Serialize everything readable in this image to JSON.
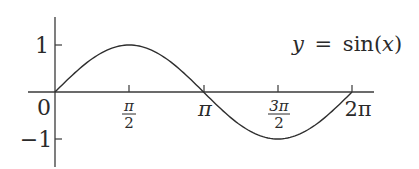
{
  "chart_data": {
    "type": "line",
    "title": "",
    "annotation": "y = sin(x)",
    "annotation_parts": {
      "y": "y",
      "eq": "=",
      "fn": "sin",
      "open": "(",
      "x": "x",
      "close": ")"
    },
    "xlabel": "",
    "ylabel": "",
    "xlim": [
      0,
      6.2832
    ],
    "ylim": [
      -1,
      1
    ],
    "grid": false,
    "legend": "none",
    "x_ticks": [
      {
        "value": 0,
        "label": "0"
      },
      {
        "value": 1.5708,
        "label": "π/2",
        "num": "π",
        "den": "2"
      },
      {
        "value": 3.1416,
        "label": "π"
      },
      {
        "value": 4.7124,
        "label": "3π/2",
        "num": "3π",
        "den": "2"
      },
      {
        "value": 6.2832,
        "label": "2π"
      }
    ],
    "y_ticks": [
      {
        "value": 1,
        "label": "1"
      },
      {
        "value": -1,
        "label": "−1"
      }
    ],
    "series": [
      {
        "name": "sin(x)",
        "x": [
          0,
          0.7854,
          1.5708,
          2.3562,
          3.1416,
          3.927,
          4.7124,
          5.4978,
          6.2832
        ],
        "values": [
          0,
          0.7071,
          1,
          0.7071,
          0,
          -0.7071,
          -1,
          -0.7071,
          0
        ]
      }
    ],
    "colors": {
      "axis": "#3a3a3a",
      "curve": "#2e2e2e",
      "text": "#2a2a2a",
      "background": "#ffffff"
    }
  }
}
